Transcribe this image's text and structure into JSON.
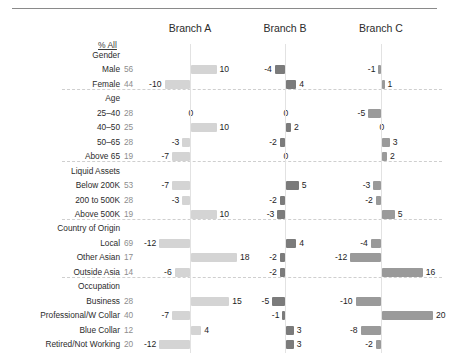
{
  "chart_data": {
    "type": "bar",
    "title": "",
    "subtitle": "",
    "xlabel": "",
    "ylabel": "",
    "grid": false,
    "legend_position": "none",
    "orientation": "horizontal-diverging",
    "note": "Index/difference bars centred on a zero axis under each branch column; left column shows % All for the total sample.",
    "pct_all_header": "% All",
    "series": [
      {
        "name": "Branch A",
        "values": [
          10,
          -10,
          0,
          10,
          -3,
          -7,
          -7,
          -3,
          10,
          -12,
          18,
          -6,
          15,
          -7,
          4,
          -12
        ]
      },
      {
        "name": "Branch B",
        "values": [
          -4,
          4,
          0,
          2,
          -2,
          0,
          5,
          -2,
          -3,
          4,
          -2,
          -2,
          -5,
          -1,
          3,
          3
        ]
      },
      {
        "name": "Branch C",
        "values": [
          -1,
          1,
          -5,
          0,
          3,
          2,
          -3,
          -2,
          5,
          -4,
          -12,
          16,
          -10,
          20,
          -8,
          -2
        ]
      }
    ],
    "categories": [
      "Male",
      "Female",
      "25–40",
      "40–50",
      "50–65",
      "Above 65",
      "Below 200K",
      "200 to 500K",
      "Above 500K",
      "Local",
      "Other Asian",
      "Outside Asia",
      "Business",
      "Professional/W Collar",
      "Blue Collar",
      "Retired/Not Working"
    ],
    "pct_all": [
      56,
      44,
      28,
      25,
      28,
      19,
      53,
      28,
      19,
      69,
      17,
      14,
      28,
      40,
      12,
      20
    ],
    "groups": [
      {
        "label": "Gender",
        "rows": [
          "Male",
          "Female"
        ]
      },
      {
        "label": "Age",
        "rows": [
          "25–40",
          "40–50",
          "50–65",
          "Above 65"
        ]
      },
      {
        "label": "Liquid Assets",
        "rows": [
          "Below 200K",
          "200 to 500K",
          "Above 500K"
        ]
      },
      {
        "label": "Country of Origin",
        "rows": [
          "Local",
          "Other Asian",
          "Outside Asia"
        ]
      },
      {
        "label": "Occupation",
        "rows": [
          "Business",
          "Professional/W Collar",
          "Blue Collar",
          "Retired/Not Working"
        ]
      }
    ],
    "colors": {
      "branch_a": "#d4d4d4",
      "branch_b": "#7b7b7b",
      "branch_c": "#9a9a9a",
      "rule": "#8a8a8a",
      "separator": "#cfcfcf"
    }
  },
  "header": {
    "pct_all_label": "% All",
    "branches": [
      "Branch A",
      "Branch B",
      "Branch C"
    ]
  },
  "rows": [
    {
      "kind": "group",
      "label": "Gender"
    },
    {
      "kind": "row",
      "label": "Male",
      "pct": "56",
      "a": "10",
      "b": "-4",
      "c": "-1"
    },
    {
      "kind": "row",
      "label": "Female",
      "pct": "44",
      "a": "-10",
      "b": "4",
      "c": "1"
    },
    {
      "kind": "group",
      "label": "Age"
    },
    {
      "kind": "row",
      "label": "25–40",
      "pct": "28",
      "a": "0",
      "b": "0",
      "c": "-5"
    },
    {
      "kind": "row",
      "label": "40–50",
      "pct": "25",
      "a": "10",
      "b": "2",
      "c": "0"
    },
    {
      "kind": "row",
      "label": "50–65",
      "pct": "28",
      "a": "-3",
      "b": "-2",
      "c": "3"
    },
    {
      "kind": "row",
      "label": "Above 65",
      "pct": "19",
      "a": "-7",
      "b": "0",
      "c": "2"
    },
    {
      "kind": "group",
      "label": "Liquid Assets"
    },
    {
      "kind": "row",
      "label": "Below 200K",
      "pct": "53",
      "a": "-7",
      "b": "5",
      "c": "-3"
    },
    {
      "kind": "row",
      "label": "200 to 500K",
      "pct": "28",
      "a": "-3",
      "b": "-2",
      "c": "-2"
    },
    {
      "kind": "row",
      "label": "Above 500K",
      "pct": "19",
      "a": "10",
      "b": "-3",
      "c": "5"
    },
    {
      "kind": "group",
      "label": "Country of Origin"
    },
    {
      "kind": "row",
      "label": "Local",
      "pct": "69",
      "a": "-12",
      "b": "4",
      "c": "-4"
    },
    {
      "kind": "row",
      "label": "Other Asian",
      "pct": "17",
      "a": "18",
      "b": "-2",
      "c": "-12"
    },
    {
      "kind": "row",
      "label": "Outside Asia",
      "pct": "14",
      "a": "-6",
      "b": "-2",
      "c": "16"
    },
    {
      "kind": "group",
      "label": "Occupation"
    },
    {
      "kind": "row",
      "label": "Business",
      "pct": "28",
      "a": "15",
      "b": "-5",
      "c": "-10"
    },
    {
      "kind": "row",
      "label": "Professional/W Collar",
      "pct": "40",
      "a": "-7",
      "b": "-1",
      "c": "20"
    },
    {
      "kind": "row",
      "label": "Blue Collar",
      "pct": "12",
      "a": "4",
      "b": "3",
      "c": "-8"
    },
    {
      "kind": "row",
      "label": "Retired/Not Working",
      "pct": "20",
      "a": "-12",
      "b": "3",
      "c": "-2"
    }
  ]
}
